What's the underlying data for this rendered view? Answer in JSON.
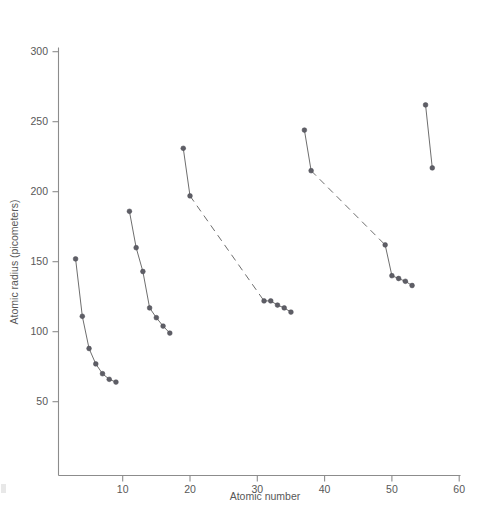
{
  "chart_data": {
    "type": "line",
    "title": "",
    "xlabel": "Atomic number",
    "ylabel": "Atomic radius (picometers)",
    "xlim": [
      0,
      60
    ],
    "ylim": [
      0,
      300
    ],
    "xticks": [
      10,
      20,
      30,
      40,
      50,
      60
    ],
    "yticks": [
      50,
      100,
      150,
      200,
      250,
      300
    ],
    "grid": false,
    "legend": "none",
    "marker": "filled-circle",
    "series": [
      {
        "name": "Period 2 (Li-F)",
        "connector": "solid",
        "x": [
          3,
          4,
          5,
          6,
          7,
          8,
          9
        ],
        "y": [
          152,
          111,
          88,
          77,
          70,
          66,
          64
        ]
      },
      {
        "name": "Period 3 (Na-Cl)",
        "connector": "solid",
        "x": [
          11,
          12,
          13,
          14,
          15,
          16,
          17
        ],
        "y": [
          186,
          160,
          143,
          117,
          110,
          104,
          99
        ]
      },
      {
        "name": "Period 4 (K-Ca, Ga-Br)",
        "connector": "solid-with-dashed-gap",
        "dashed_between_index": 1,
        "x": [
          19,
          20,
          31,
          32,
          33,
          34,
          35
        ],
        "y": [
          231,
          197,
          122,
          122,
          119,
          117,
          114
        ]
      },
      {
        "name": "Period 5 (Rb-Sr, In-I)",
        "connector": "solid-with-dashed-gap",
        "dashed_between_index": 1,
        "x": [
          37,
          38,
          49,
          50,
          51,
          52,
          53
        ],
        "y": [
          244,
          215,
          162,
          140,
          138,
          136,
          133
        ]
      },
      {
        "name": "Period 6 (Cs-Ba)",
        "connector": "solid",
        "x": [
          55,
          56
        ],
        "y": [
          262,
          217
        ]
      }
    ]
  },
  "colors": {
    "axis": "#8c8c8c",
    "line": "#6e6e6e",
    "marker": "#5e5e66",
    "text": "#585858",
    "background": "#ffffff"
  },
  "tick_labels": {
    "y": [
      "50",
      "100",
      "150",
      "200",
      "250",
      "300"
    ],
    "x": [
      "10",
      "20",
      "30",
      "40",
      "50",
      "60"
    ]
  }
}
